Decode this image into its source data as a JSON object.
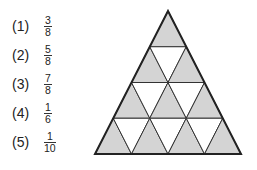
{
  "options": [
    {
      "label": "(1)",
      "numerator": "3",
      "denominator": "8"
    },
    {
      "label": "(2)",
      "numerator": "5",
      "denominator": "8"
    },
    {
      "label": "(3)",
      "numerator": "7",
      "denominator": "8"
    },
    {
      "label": "(4)",
      "numerator": "1",
      "denominator": "6"
    },
    {
      "label": "(5)",
      "numerator": "1",
      "denominator": "10"
    }
  ],
  "figure": {
    "type": "triangle-grid",
    "rows": 4,
    "shaded": "upward triangles (10 of 16)",
    "shade_color": "#d4d4d4",
    "line_color": "#333333"
  }
}
